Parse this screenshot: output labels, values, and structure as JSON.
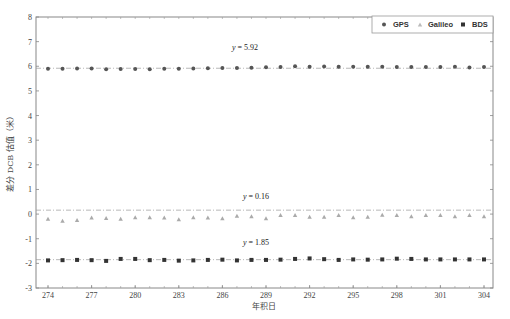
{
  "chart_data": {
    "type": "scatter",
    "title": "",
    "xlabel": "年积日",
    "ylabel": "差分 DCB 估值（米）",
    "xlim": [
      273,
      304
    ],
    "ylim": [
      -3,
      8
    ],
    "xticks": [
      274,
      277,
      280,
      283,
      286,
      289,
      292,
      295,
      298,
      301,
      304
    ],
    "yticks": [
      -3,
      -2,
      -1,
      0,
      1,
      2,
      3,
      4,
      5,
      6,
      7,
      8
    ],
    "grid": false,
    "legend_position": "upper right",
    "x": [
      274,
      275,
      276,
      277,
      278,
      279,
      280,
      281,
      282,
      283,
      284,
      285,
      286,
      287,
      288,
      289,
      290,
      291,
      292,
      293,
      294,
      295,
      296,
      297,
      298,
      299,
      300,
      301,
      302,
      303,
      304
    ],
    "series": [
      {
        "name": "GPS",
        "marker": "circle",
        "color": "#555555",
        "mean": 5.92,
        "annotation": "y = 5.92",
        "values": [
          5.9,
          5.9,
          5.91,
          5.91,
          5.88,
          5.89,
          5.89,
          5.88,
          5.9,
          5.9,
          5.91,
          5.92,
          5.93,
          5.93,
          5.94,
          5.96,
          5.97,
          6.0,
          5.98,
          5.99,
          5.98,
          5.98,
          5.98,
          5.98,
          5.97,
          5.97,
          5.97,
          5.97,
          5.98,
          5.95,
          5.97
        ]
      },
      {
        "name": "Galileo",
        "marker": "triangle",
        "color": "#aaaaaa",
        "mean": 0.16,
        "annotation": "y = 0.16",
        "values": [
          -0.2,
          -0.28,
          -0.25,
          -0.15,
          -0.17,
          -0.2,
          -0.14,
          -0.14,
          -0.15,
          -0.22,
          -0.14,
          -0.15,
          -0.18,
          -0.08,
          -0.1,
          -0.18,
          -0.05,
          -0.05,
          -0.12,
          -0.12,
          -0.05,
          -0.14,
          -0.12,
          -0.03,
          -0.05,
          -0.1,
          -0.04,
          -0.04,
          -0.1,
          -0.04,
          -0.1
        ]
      },
      {
        "name": "BDS",
        "marker": "square",
        "color": "#333333",
        "mean": -1.85,
        "annotation": "y = 1.85",
        "values": [
          -1.88,
          -1.87,
          -1.86,
          -1.87,
          -1.9,
          -1.82,
          -1.82,
          -1.87,
          -1.86,
          -1.89,
          -1.88,
          -1.86,
          -1.85,
          -1.88,
          -1.86,
          -1.86,
          -1.85,
          -1.82,
          -1.8,
          -1.83,
          -1.86,
          -1.84,
          -1.85,
          -1.84,
          -1.81,
          -1.82,
          -1.84,
          -1.84,
          -1.84,
          -1.84,
          -1.84
        ]
      }
    ]
  },
  "legend": {
    "items": [
      "GPS",
      "Galileo",
      "BDS"
    ]
  }
}
